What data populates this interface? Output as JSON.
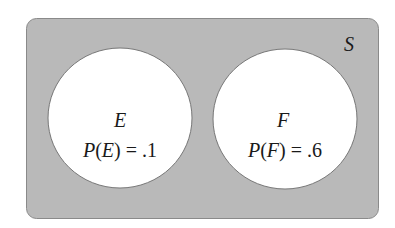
{
  "diagram": {
    "type": "venn",
    "sample_space": {
      "label": "S",
      "fill": "#b9b9b9",
      "stroke": "#8a8a8a"
    },
    "sets": [
      {
        "id": "E",
        "name": "E",
        "probability_label": "P(E) = .1",
        "prob_prefix": "P(",
        "prob_var": "E",
        "prob_suffix": ") = .1",
        "probability": 0.1,
        "fill": "#ffffff"
      },
      {
        "id": "F",
        "name": "F",
        "probability_label": "P(F) = .6",
        "prob_prefix": "P(",
        "prob_var": "F",
        "prob_suffix": ") = .6",
        "probability": 0.6,
        "fill": "#ffffff"
      }
    ],
    "relationship": "mutually exclusive (disjoint)"
  }
}
